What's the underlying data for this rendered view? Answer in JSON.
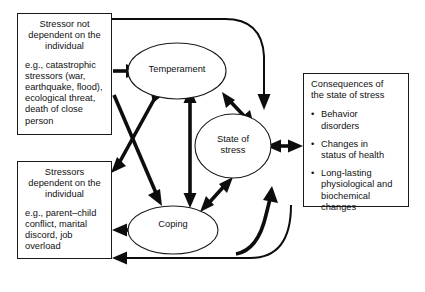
{
  "diagram": {
    "type": "flow-diagram",
    "title_visible": false,
    "boxes": [
      {
        "id": "stressor-not-dependent",
        "title": "Stressor not\ndependent on the\nindividual",
        "body": "e.g., catastrophic\nstressors (war,\nearthquake, flood),\necological threat,\ndeath of close\nperson"
      },
      {
        "id": "stressor-dependent",
        "title": "Stressors\ndependent on the\nindividual",
        "body": "e.g., parent–child\nconflict, marital\ndiscord, job\noverload"
      },
      {
        "id": "consequences",
        "title": "Consequences of\nthe state of stress",
        "bullets": [
          "Behavior\ndisorders",
          "Changes in\nstatus of health",
          "Long-lasting\nphysiological and\nbiochemical\nchanges"
        ]
      }
    ],
    "nodes": [
      {
        "id": "temperament",
        "label": "Temperament"
      },
      {
        "id": "state-of-stress",
        "label": "State of\nstress"
      },
      {
        "id": "coping",
        "label": "Coping"
      }
    ],
    "edges": [
      {
        "from": "stressor-not-dependent",
        "to": "temperament",
        "direction": "one-way"
      },
      {
        "from": "stressor-not-dependent",
        "to": "coping",
        "direction": "one-way"
      },
      {
        "from": "stressor-not-dependent",
        "to": "state-of-stress",
        "direction": "one-way"
      },
      {
        "from": "temperament",
        "to": "stressor-dependent",
        "direction": "two-way"
      },
      {
        "from": "temperament",
        "to": "coping",
        "direction": "two-way"
      },
      {
        "from": "temperament",
        "to": "state-of-stress",
        "direction": "two-way"
      },
      {
        "from": "coping",
        "to": "state-of-stress",
        "direction": "two-way"
      },
      {
        "from": "coping",
        "to": "stressor-dependent",
        "direction": "two-way"
      },
      {
        "from": "state-of-stress",
        "to": "consequences",
        "direction": "two-way"
      },
      {
        "from": "state-of-stress",
        "to": "stressor-dependent",
        "direction": "one-way"
      },
      {
        "from": "coping",
        "to": "state-of-stress",
        "direction": "one-way",
        "note": "lower curve"
      }
    ],
    "colors": {
      "stroke": "#1a1a1a",
      "arrow": "#0d0d0d",
      "background": "#ffffff",
      "text": "#111111"
    }
  }
}
